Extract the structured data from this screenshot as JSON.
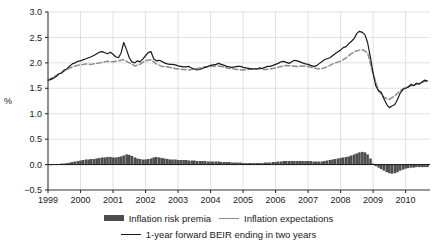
{
  "chart_data": {
    "type": "line",
    "title": "",
    "xlabel": "",
    "ylabel": "%",
    "ylim": [
      -0.5,
      3.0
    ],
    "yticks": [
      "-0.5",
      "0.0",
      "0.5",
      "1.0",
      "1.5",
      "2.0",
      "2.5",
      "3.0"
    ],
    "ytick_values": [
      -0.5,
      0.0,
      0.5,
      1.0,
      1.5,
      2.0,
      2.5,
      3.0
    ],
    "xticks": [
      "1999",
      "2000",
      "2001",
      "2002",
      "2003",
      "2004",
      "2005",
      "2006",
      "2007",
      "2008",
      "2009",
      "2010"
    ],
    "xlim": [
      1999.0,
      2010.75
    ],
    "grid": true,
    "legend_position": "bottom",
    "colors": {
      "bars": "#4d4d4d",
      "expectations_line": "#8c8c8c",
      "beir_line": "#1a1a1a",
      "grid": "#cccccc",
      "axis": "#333333"
    },
    "series": [
      {
        "name": "Inflation risk premia",
        "type": "bar",
        "color": "#4d4d4d",
        "x": [
          1999.0,
          1999.08,
          1999.17,
          1999.25,
          1999.33,
          1999.42,
          1999.5,
          1999.58,
          1999.67,
          1999.75,
          1999.83,
          1999.92,
          2000.0,
          2000.08,
          2000.17,
          2000.25,
          2000.33,
          2000.42,
          2000.5,
          2000.58,
          2000.67,
          2000.75,
          2000.83,
          2000.92,
          2001.0,
          2001.08,
          2001.17,
          2001.25,
          2001.33,
          2001.42,
          2001.5,
          2001.58,
          2001.67,
          2001.75,
          2001.83,
          2001.92,
          2002.0,
          2002.08,
          2002.17,
          2002.25,
          2002.33,
          2002.42,
          2002.5,
          2002.58,
          2002.67,
          2002.75,
          2002.83,
          2002.92,
          2003.0,
          2003.08,
          2003.17,
          2003.25,
          2003.33,
          2003.42,
          2003.5,
          2003.58,
          2003.67,
          2003.75,
          2003.83,
          2003.92,
          2004.0,
          2004.08,
          2004.17,
          2004.25,
          2004.33,
          2004.42,
          2004.5,
          2004.58,
          2004.67,
          2004.75,
          2004.83,
          2004.92,
          2005.0,
          2005.08,
          2005.17,
          2005.25,
          2005.33,
          2005.42,
          2005.5,
          2005.58,
          2005.67,
          2005.75,
          2005.83,
          2005.92,
          2006.0,
          2006.08,
          2006.17,
          2006.25,
          2006.33,
          2006.42,
          2006.5,
          2006.58,
          2006.67,
          2006.75,
          2006.83,
          2006.92,
          2007.0,
          2007.08,
          2007.17,
          2007.25,
          2007.33,
          2007.42,
          2007.5,
          2007.58,
          2007.67,
          2007.75,
          2007.83,
          2007.92,
          2008.0,
          2008.08,
          2008.17,
          2008.25,
          2008.33,
          2008.42,
          2008.5,
          2008.58,
          2008.67,
          2008.75,
          2008.83,
          2008.92,
          2009.0,
          2009.08,
          2009.17,
          2009.25,
          2009.33,
          2009.42,
          2009.5,
          2009.58,
          2009.67,
          2009.75,
          2009.83,
          2009.92,
          2010.0,
          2010.08,
          2010.17,
          2010.25,
          2010.33,
          2010.42,
          2010.5,
          2010.58,
          2010.67
        ],
        "values": [
          0.0,
          0.0,
          0.01,
          0.01,
          0.01,
          0.02,
          0.02,
          0.03,
          0.04,
          0.05,
          0.06,
          0.07,
          0.08,
          0.09,
          0.1,
          0.1,
          0.11,
          0.11,
          0.12,
          0.13,
          0.14,
          0.14,
          0.15,
          0.15,
          0.14,
          0.14,
          0.15,
          0.16,
          0.18,
          0.2,
          0.19,
          0.17,
          0.14,
          0.12,
          0.11,
          0.1,
          0.1,
          0.11,
          0.12,
          0.14,
          0.15,
          0.14,
          0.13,
          0.12,
          0.11,
          0.1,
          0.1,
          0.1,
          0.09,
          0.09,
          0.09,
          0.09,
          0.08,
          0.08,
          0.08,
          0.07,
          0.07,
          0.07,
          0.07,
          0.06,
          0.06,
          0.06,
          0.06,
          0.06,
          0.05,
          0.05,
          0.05,
          0.05,
          0.04,
          0.04,
          0.04,
          0.04,
          0.03,
          0.03,
          0.03,
          0.03,
          0.03,
          0.03,
          0.03,
          0.03,
          0.04,
          0.04,
          0.04,
          0.05,
          0.05,
          0.06,
          0.06,
          0.07,
          0.07,
          0.07,
          0.07,
          0.07,
          0.07,
          0.07,
          0.07,
          0.07,
          0.07,
          0.07,
          0.06,
          0.06,
          0.06,
          0.06,
          0.07,
          0.08,
          0.09,
          0.1,
          0.11,
          0.12,
          0.13,
          0.14,
          0.15,
          0.16,
          0.18,
          0.2,
          0.22,
          0.24,
          0.25,
          0.24,
          0.2,
          0.12,
          0.02,
          -0.03,
          -0.06,
          -0.09,
          -0.12,
          -0.15,
          -0.17,
          -0.18,
          -0.17,
          -0.15,
          -0.12,
          -0.1,
          -0.08,
          -0.07,
          -0.06,
          -0.06,
          -0.05,
          -0.05,
          -0.05,
          -0.05,
          -0.05
        ]
      },
      {
        "name": "Inflation expectations",
        "type": "line",
        "style": "dashed",
        "color": "#8c8c8c",
        "x": [
          1999.0,
          1999.17,
          1999.33,
          1999.5,
          1999.67,
          1999.83,
          2000.0,
          2000.17,
          2000.33,
          2000.5,
          2000.67,
          2000.83,
          2001.0,
          2001.17,
          2001.33,
          2001.5,
          2001.67,
          2001.83,
          2002.0,
          2002.17,
          2002.33,
          2002.5,
          2002.67,
          2002.83,
          2003.0,
          2003.17,
          2003.33,
          2003.5,
          2003.67,
          2003.83,
          2004.0,
          2004.17,
          2004.33,
          2004.5,
          2004.67,
          2004.83,
          2005.0,
          2005.17,
          2005.33,
          2005.5,
          2005.67,
          2005.83,
          2006.0,
          2006.17,
          2006.33,
          2006.5,
          2006.67,
          2006.83,
          2007.0,
          2007.17,
          2007.33,
          2007.5,
          2007.67,
          2007.83,
          2008.0,
          2008.17,
          2008.33,
          2008.5,
          2008.67,
          2008.83,
          2009.0,
          2009.17,
          2009.33,
          2009.5,
          2009.67,
          2009.83,
          2010.0,
          2010.17,
          2010.33,
          2010.5,
          2010.67
        ],
        "values": [
          1.66,
          1.72,
          1.78,
          1.84,
          1.9,
          1.94,
          1.96,
          1.98,
          1.97,
          1.99,
          2.01,
          2.03,
          2.02,
          2.04,
          2.06,
          2.0,
          1.94,
          1.97,
          2.04,
          2.06,
          1.98,
          1.93,
          1.92,
          1.9,
          1.88,
          1.87,
          1.86,
          1.88,
          1.9,
          1.92,
          1.93,
          1.94,
          1.93,
          1.9,
          1.88,
          1.87,
          1.86,
          1.87,
          1.88,
          1.88,
          1.87,
          1.88,
          1.9,
          1.93,
          1.95,
          1.94,
          1.93,
          1.94,
          1.93,
          1.9,
          1.88,
          1.9,
          1.95,
          2.0,
          2.03,
          2.1,
          2.18,
          2.24,
          2.26,
          2.2,
          1.78,
          1.45,
          1.32,
          1.28,
          1.35,
          1.45,
          1.52,
          1.55,
          1.58,
          1.62,
          1.65
        ]
      },
      {
        "name": "1-year forward BEIR ending in two years",
        "type": "line",
        "style": "solid",
        "color": "#1a1a1a",
        "x": [
          1999.0,
          1999.08,
          1999.17,
          1999.25,
          1999.33,
          1999.42,
          1999.5,
          1999.58,
          1999.67,
          1999.75,
          1999.83,
          1999.92,
          2000.0,
          2000.08,
          2000.17,
          2000.25,
          2000.33,
          2000.42,
          2000.5,
          2000.58,
          2000.67,
          2000.75,
          2000.83,
          2000.92,
          2001.0,
          2001.08,
          2001.17,
          2001.25,
          2001.33,
          2001.42,
          2001.5,
          2001.58,
          2001.67,
          2001.75,
          2001.83,
          2001.92,
          2002.0,
          2002.08,
          2002.17,
          2002.25,
          2002.33,
          2002.42,
          2002.5,
          2002.58,
          2002.67,
          2002.75,
          2002.83,
          2002.92,
          2003.0,
          2003.08,
          2003.17,
          2003.25,
          2003.33,
          2003.42,
          2003.5,
          2003.58,
          2003.67,
          2003.75,
          2003.83,
          2003.92,
          2004.0,
          2004.08,
          2004.17,
          2004.25,
          2004.33,
          2004.42,
          2004.5,
          2004.58,
          2004.67,
          2004.75,
          2004.83,
          2004.92,
          2005.0,
          2005.08,
          2005.17,
          2005.25,
          2005.33,
          2005.42,
          2005.5,
          2005.58,
          2005.67,
          2005.75,
          2005.83,
          2005.92,
          2006.0,
          2006.08,
          2006.17,
          2006.25,
          2006.33,
          2006.42,
          2006.5,
          2006.58,
          2006.67,
          2006.75,
          2006.83,
          2006.92,
          2007.0,
          2007.08,
          2007.17,
          2007.25,
          2007.33,
          2007.42,
          2007.5,
          2007.58,
          2007.67,
          2007.75,
          2007.83,
          2007.92,
          2008.0,
          2008.08,
          2008.17,
          2008.25,
          2008.33,
          2008.42,
          2008.5,
          2008.58,
          2008.67,
          2008.75,
          2008.83,
          2008.92,
          2009.0,
          2009.08,
          2009.17,
          2009.25,
          2009.33,
          2009.42,
          2009.5,
          2009.58,
          2009.67,
          2009.75,
          2009.83,
          2009.92,
          2010.0,
          2010.08,
          2010.17,
          2010.25,
          2010.33,
          2010.42,
          2010.5,
          2010.58,
          2010.67
        ],
        "values": [
          1.66,
          1.67,
          1.7,
          1.73,
          1.78,
          1.8,
          1.86,
          1.88,
          1.94,
          1.98,
          2.0,
          2.03,
          2.04,
          2.06,
          2.08,
          2.1,
          2.12,
          2.15,
          2.18,
          2.21,
          2.22,
          2.2,
          2.18,
          2.21,
          2.17,
          2.12,
          2.1,
          2.2,
          2.4,
          2.25,
          2.1,
          2.02,
          2.0,
          2.04,
          2.02,
          2.08,
          2.14,
          2.2,
          2.22,
          2.08,
          2.04,
          2.05,
          2.03,
          2.0,
          1.98,
          1.97,
          1.97,
          1.96,
          1.94,
          1.93,
          1.92,
          1.92,
          1.93,
          1.9,
          1.88,
          1.86,
          1.87,
          1.89,
          1.91,
          1.93,
          1.95,
          1.96,
          1.97,
          1.99,
          1.97,
          1.95,
          1.93,
          1.92,
          1.91,
          1.92,
          1.93,
          1.93,
          1.91,
          1.9,
          1.89,
          1.88,
          1.88,
          1.88,
          1.9,
          1.89,
          1.91,
          1.93,
          1.93,
          1.95,
          1.97,
          1.99,
          2.02,
          2.03,
          2.01,
          1.99,
          2.02,
          2.05,
          2.04,
          2.02,
          2.0,
          1.98,
          1.97,
          1.95,
          1.93,
          1.94,
          1.98,
          2.02,
          2.06,
          2.08,
          2.1,
          2.14,
          2.18,
          2.22,
          2.25,
          2.3,
          2.32,
          2.38,
          2.42,
          2.48,
          2.58,
          2.62,
          2.6,
          2.55,
          2.4,
          2.1,
          1.8,
          1.55,
          1.45,
          1.42,
          1.3,
          1.18,
          1.12,
          1.15,
          1.18,
          1.28,
          1.4,
          1.48,
          1.5,
          1.52,
          1.58,
          1.55,
          1.6,
          1.58,
          1.62,
          1.66,
          1.64
        ]
      }
    ]
  },
  "legend": {
    "items": [
      {
        "label": "Inflation risk premia",
        "marker": "bar-swatch"
      },
      {
        "label": "Inflation expectations",
        "marker": "gray-line-swatch"
      },
      {
        "label": "1-year forward BEIR ending in two years",
        "marker": "black-line-swatch"
      }
    ]
  }
}
